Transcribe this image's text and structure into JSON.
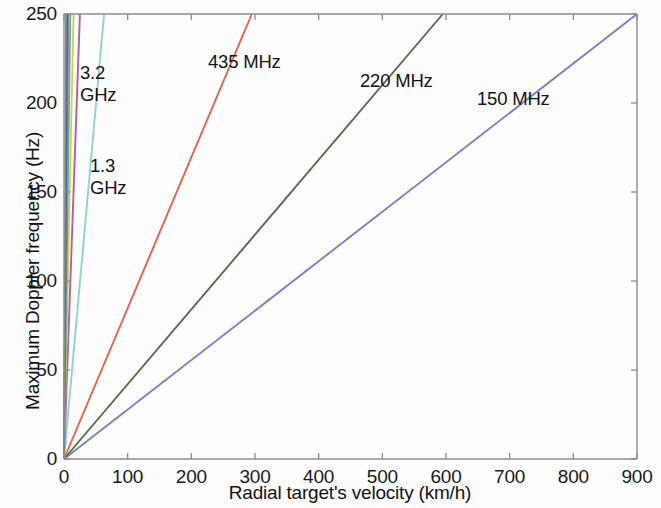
{
  "chart_data": {
    "type": "line",
    "title": "",
    "xlabel": "Radial target's velocity (km/h)",
    "ylabel": "Maximum Doppler frequency (Hz)",
    "xlim": [
      0,
      900
    ],
    "ylim": [
      0,
      250
    ],
    "xticks": [
      0,
      100,
      200,
      300,
      400,
      500,
      600,
      700,
      800,
      900
    ],
    "yticks": [
      0,
      50,
      100,
      150,
      200,
      250
    ],
    "xtick_labels": [
      "0",
      "100",
      "200",
      "300",
      "400",
      "500",
      "600",
      "700",
      "800",
      "900"
    ],
    "ytick_labels": [
      "0",
      "50",
      "100",
      "150",
      "200",
      "250"
    ],
    "grid": false,
    "legend": "inline-annotations",
    "series": [
      {
        "name": "150 MHz",
        "color": "#7b7fc4",
        "slope_hz_per_kmh": 0.2778,
        "x": [
          0,
          900
        ],
        "values": [
          0,
          250
        ],
        "label_text": "150 MHz",
        "label_x_px": 477,
        "label_y_px": 88
      },
      {
        "name": "220 MHz",
        "color": "#4f7046",
        "slope_hz_per_kmh": 0.4202,
        "x": [
          0,
          595
        ],
        "values": [
          0,
          250
        ],
        "label_text": "220 MHz",
        "label_x_px": 360,
        "label_y_px": 70
      },
      {
        "name": "435 MHz",
        "color": "#e8604c",
        "slope_hz_per_kmh": 0.8475,
        "x": [
          0,
          295
        ],
        "values": [
          0,
          250
        ],
        "label_text": "435 MHz",
        "label_x_px": 208,
        "label_y_px": 51
      },
      {
        "name": "1.3 GHz",
        "color": "#8fd0d9",
        "slope_hz_per_kmh": 3.9683,
        "x": [
          0,
          63
        ],
        "values": [
          0,
          250
        ],
        "label_text": "1.3\nGHz",
        "label_x_px": 90,
        "label_y_px": 155
      },
      {
        "name": "3.2 GHz",
        "color": "#b0609a",
        "slope_hz_per_kmh": 10.0,
        "x": [
          0,
          25
        ],
        "values": [
          0,
          250
        ],
        "label_text": "3.2\nGHz",
        "label_x_px": 80,
        "label_y_px": 62
      },
      {
        "name": "unlabeled-higher-band-1",
        "color": "#c6d14a",
        "slope_hz_per_kmh": 16.7,
        "x": [
          0,
          15
        ],
        "values": [
          0,
          250
        ],
        "label_text": "",
        "label_x_px": null,
        "label_y_px": null
      },
      {
        "name": "unlabeled-higher-band-2",
        "color": "#5fa7a0",
        "slope_hz_per_kmh": 25.0,
        "x": [
          0,
          10
        ],
        "values": [
          0,
          250
        ],
        "label_text": "",
        "label_x_px": null,
        "label_y_px": null
      },
      {
        "name": "unlabeled-higher-band-3",
        "color": "#8a8a8a",
        "slope_hz_per_kmh": 35.7,
        "x": [
          0,
          7
        ],
        "values": [
          0,
          250
        ],
        "label_text": "",
        "label_x_px": null,
        "label_y_px": null
      },
      {
        "name": "unlabeled-higher-band-4",
        "color": "#4a5d80",
        "slope_hz_per_kmh": 50.0,
        "x": [
          0,
          5
        ],
        "values": [
          0,
          250
        ],
        "label_text": "",
        "label_x_px": null,
        "label_y_px": null
      },
      {
        "name": "unlabeled-higher-band-5",
        "color": "#6d8aa8",
        "slope_hz_per_kmh": 83.3,
        "x": [
          0,
          3
        ],
        "values": [
          0,
          250
        ],
        "label_text": "",
        "label_x_px": null,
        "label_y_px": null
      }
    ]
  },
  "axes": {
    "x_title": "Radial target's velocity (km/h)",
    "y_title": "Maximum Doppler frequency (Hz)"
  },
  "colors": {
    "axis": "#8c8c8c",
    "text": "#111111",
    "background": "#fdfdfd"
  }
}
